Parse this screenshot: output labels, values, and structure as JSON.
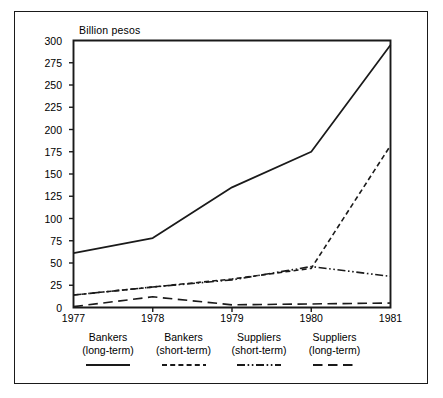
{
  "chart_data": {
    "type": "line",
    "title": "",
    "subtitle": "",
    "ylabel": "Billion pesos",
    "xlabel": "",
    "x": [
      "1977",
      "1978",
      "1979",
      "1980",
      "1981"
    ],
    "ylim": [
      0,
      300
    ],
    "xlim": [
      "1977",
      "1981"
    ],
    "yticks": [
      0,
      25,
      50,
      75,
      100,
      125,
      150,
      175,
      200,
      225,
      250,
      275,
      300
    ],
    "ytick_labels": [
      "0",
      "25",
      "50",
      "75",
      "100",
      "125",
      "150",
      "175",
      "200",
      "225",
      "250",
      "275",
      "300"
    ],
    "xtick_labels": [
      "1977",
      "1978",
      "1979",
      "1980",
      "1981"
    ],
    "grid": false,
    "legend_position": "below",
    "series": [
      {
        "name": "Bankers (long-term)",
        "label_line1": "Bankers",
        "label_line2": "(long-term)",
        "style": "solid",
        "values": [
          61,
          78,
          135,
          175,
          295
        ]
      },
      {
        "name": "Bankers (short-term)",
        "label_line1": "Bankers",
        "label_line2": "(short-term)",
        "style": "dashed",
        "values": [
          14,
          23,
          32,
          44,
          182
        ]
      },
      {
        "name": "Suppliers (short-term)",
        "label_line1": "Suppliers",
        "label_line2": "(short-term)",
        "style": "dash-dot-dot",
        "values": [
          14,
          23,
          31,
          46,
          35
        ]
      },
      {
        "name": "Suppliers (long-term)",
        "label_line1": "Suppliers",
        "label_line2": "(long-term)",
        "style": "long-dash",
        "values": [
          1,
          12,
          3,
          4,
          5
        ]
      }
    ],
    "colors": {
      "axis": "#1a1a1a",
      "series": "#1a1a1a",
      "background": "#ffffff"
    }
  }
}
